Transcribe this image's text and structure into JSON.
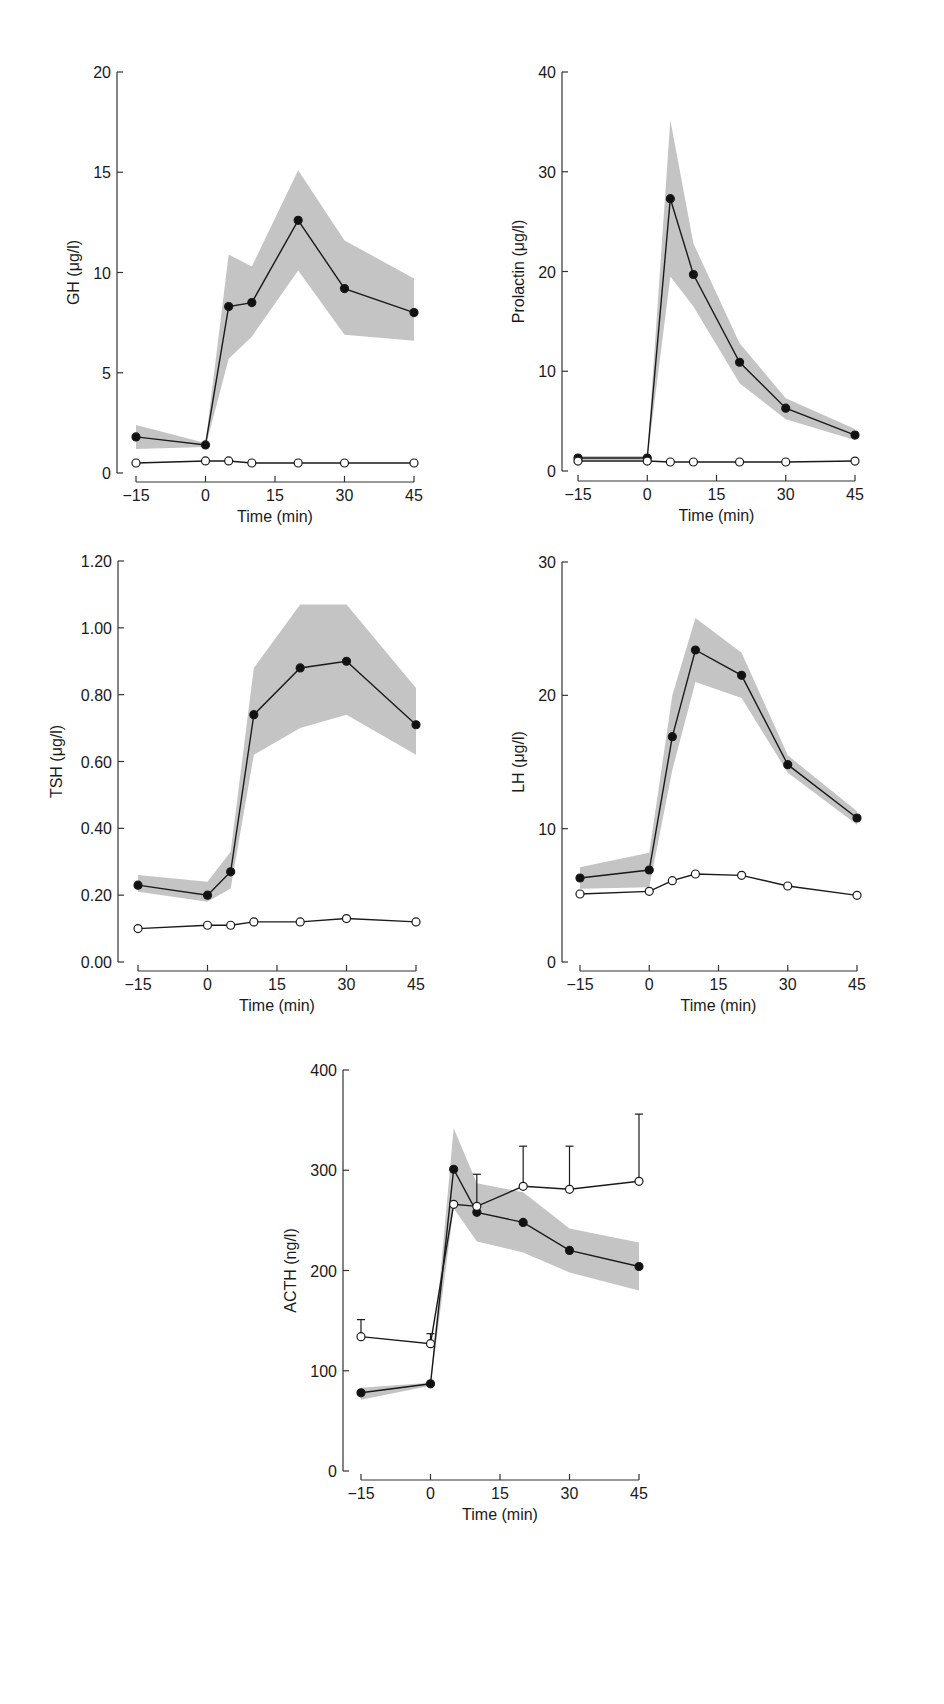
{
  "figure": {
    "colors": {
      "band": "#c4c4c4",
      "line": "#1a1a1a",
      "closed_marker": "#111111",
      "open_marker": "#ffffff",
      "axis": "#333333"
    }
  },
  "chart_data": [
    {
      "id": "gh",
      "type": "line",
      "title": "",
      "xlabel": "Time (min)",
      "ylabel": "GH (μg/l)",
      "x": [
        -15,
        0,
        5,
        10,
        20,
        30,
        45
      ],
      "xticks": [
        -15,
        0,
        15,
        30,
        45
      ],
      "xtick_labels": [
        "−15",
        "0",
        "15",
        "30",
        "45"
      ],
      "yticks": [
        0,
        5,
        10,
        15,
        20
      ],
      "ytick_labels": [
        "0",
        "5",
        "10",
        "15",
        "20"
      ],
      "ylim": [
        0,
        20
      ],
      "xlim": [
        -15,
        45
      ],
      "grid": false,
      "series": [
        {
          "name": "closed circles (mean ± SEM band)",
          "marker": "filled",
          "values": [
            1.8,
            1.4,
            8.3,
            8.5,
            12.6,
            9.2,
            8.0
          ],
          "band_upper": [
            2.4,
            1.5,
            10.9,
            10.3,
            15.1,
            11.6,
            9.7
          ],
          "band_lower": [
            1.2,
            1.3,
            5.7,
            6.8,
            10.1,
            6.9,
            6.6
          ]
        },
        {
          "name": "open circles",
          "marker": "open",
          "values": [
            0.5,
            0.6,
            0.6,
            0.5,
            0.5,
            0.5,
            0.5
          ]
        }
      ],
      "frame": {
        "x0": 117,
        "y_top": 72,
        "y_bottom": 473,
        "px_left": 136,
        "px_right": 414,
        "xaxis_y": 482
      }
    },
    {
      "id": "prolactin",
      "type": "line",
      "title": "",
      "xlabel": "Time (min)",
      "ylabel": "Prolactin (μg/l)",
      "x": [
        -15,
        0,
        5,
        10,
        20,
        30,
        45
      ],
      "xticks": [
        -15,
        0,
        15,
        30,
        45
      ],
      "xtick_labels": [
        "−15",
        "0",
        "15",
        "30",
        "45"
      ],
      "yticks": [
        0,
        10,
        20,
        30,
        40
      ],
      "ytick_labels": [
        "0",
        "10",
        "20",
        "30",
        "40"
      ],
      "ylim": [
        0,
        40
      ],
      "xlim": [
        -15,
        45
      ],
      "grid": false,
      "series": [
        {
          "name": "closed circles (mean ± SEM band)",
          "marker": "filled",
          "values": [
            1.3,
            1.3,
            27.3,
            19.7,
            10.9,
            6.3,
            3.6
          ],
          "band_upper": [
            1.5,
            1.5,
            35.2,
            22.8,
            12.8,
            7.3,
            4.2
          ],
          "band_lower": [
            1.1,
            1.1,
            19.5,
            16.5,
            8.8,
            5.2,
            3.1
          ]
        },
        {
          "name": "open circles",
          "marker": "open",
          "values": [
            1.0,
            1.0,
            0.9,
            0.9,
            0.9,
            0.9,
            1.0
          ]
        }
      ],
      "frame": {
        "x0": 562,
        "y_top": 72,
        "y_bottom": 471,
        "px_left": 578,
        "px_right": 855,
        "xaxis_y": 481
      }
    },
    {
      "id": "tsh",
      "type": "line",
      "title": "",
      "xlabel": "Time (min)",
      "ylabel": "TSH (μg/l)",
      "x": [
        -15,
        0,
        5,
        10,
        20,
        30,
        45
      ],
      "xticks": [
        -15,
        0,
        15,
        30,
        45
      ],
      "xtick_labels": [
        "−15",
        "0",
        "15",
        "30",
        "45"
      ],
      "yticks": [
        0,
        0.2,
        0.4,
        0.6,
        0.8,
        1.0,
        1.2
      ],
      "ytick_labels": [
        "0.00",
        "0.20",
        "0.40",
        "0.60",
        "0.80",
        "1.00",
        "1.20"
      ],
      "ylim": [
        0,
        1.2
      ],
      "xlim": [
        -15,
        45
      ],
      "grid": false,
      "series": [
        {
          "name": "closed circles (mean ± SEM band)",
          "marker": "filled",
          "values": [
            0.23,
            0.2,
            0.27,
            0.74,
            0.88,
            0.9,
            0.71
          ],
          "band_upper": [
            0.26,
            0.24,
            0.33,
            0.88,
            1.07,
            1.07,
            0.82
          ],
          "band_lower": [
            0.21,
            0.18,
            0.22,
            0.62,
            0.7,
            0.74,
            0.62
          ]
        },
        {
          "name": "open circles",
          "marker": "open",
          "values": [
            0.1,
            0.11,
            0.11,
            0.12,
            0.12,
            0.13,
            0.12
          ]
        }
      ],
      "frame": {
        "x0": 118,
        "y_top": 561,
        "y_bottom": 962,
        "px_left": 138,
        "px_right": 416,
        "xaxis_y": 971
      }
    },
    {
      "id": "lh",
      "type": "line",
      "title": "",
      "xlabel": "Time (min)",
      "ylabel": "LH (μg/l)",
      "x": [
        -15,
        0,
        5,
        10,
        20,
        30,
        45
      ],
      "xticks": [
        -15,
        0,
        15,
        30,
        45
      ],
      "xtick_labels": [
        "−15",
        "0",
        "15",
        "30",
        "45"
      ],
      "yticks": [
        0,
        10,
        20,
        30
      ],
      "ytick_labels": [
        "0",
        "10",
        "20",
        "30"
      ],
      "ylim": [
        0,
        30
      ],
      "xlim": [
        -15,
        45
      ],
      "grid": false,
      "series": [
        {
          "name": "closed circles (mean ± SEM band)",
          "marker": "filled",
          "values": [
            6.3,
            6.9,
            16.9,
            23.4,
            21.5,
            14.8,
            10.8
          ],
          "band_upper": [
            7.1,
            8.2,
            20.0,
            25.8,
            23.2,
            15.5,
            11.3
          ],
          "band_lower": [
            5.5,
            5.6,
            14.4,
            21.0,
            19.8,
            14.2,
            10.3
          ]
        },
        {
          "name": "open circles",
          "marker": "open",
          "values": [
            5.1,
            5.3,
            6.1,
            6.6,
            6.5,
            5.7,
            5.0
          ]
        }
      ],
      "frame": {
        "x0": 562,
        "y_top": 562,
        "y_bottom": 962,
        "px_left": 580,
        "px_right": 857,
        "xaxis_y": 971
      }
    },
    {
      "id": "acth",
      "type": "line",
      "title": "",
      "xlabel": "Time (min)",
      "ylabel": "ACTH (ng/l)",
      "x": [
        -15,
        0,
        5,
        10,
        20,
        30,
        45
      ],
      "xticks": [
        -15,
        0,
        15,
        30,
        45
      ],
      "xtick_labels": [
        "−15",
        "0",
        "15",
        "30",
        "45"
      ],
      "yticks": [
        0,
        100,
        200,
        300,
        400
      ],
      "ytick_labels": [
        "0",
        "100",
        "200",
        "300",
        "400"
      ],
      "ylim": [
        0,
        400
      ],
      "xlim": [
        -15,
        45
      ],
      "grid": false,
      "series": [
        {
          "name": "closed circles (mean ± SEM band)",
          "marker": "filled",
          "values": [
            78,
            87,
            301,
            258,
            248,
            220,
            204
          ],
          "band_upper": [
            83,
            88,
            342,
            287,
            278,
            242,
            228
          ],
          "band_lower": [
            71,
            85,
            262,
            229,
            218,
            198,
            180
          ]
        },
        {
          "name": "open circles (mean + SEM error bars)",
          "marker": "open",
          "values": [
            134,
            127,
            266,
            264,
            284,
            281,
            289
          ],
          "error_upper": [
            151,
            137,
            0,
            296,
            324,
            324,
            356
          ]
        }
      ],
      "frame": {
        "x0": 343,
        "y_top": 1070,
        "y_bottom": 1471,
        "px_left": 361,
        "px_right": 639,
        "xaxis_y": 1480
      }
    }
  ]
}
